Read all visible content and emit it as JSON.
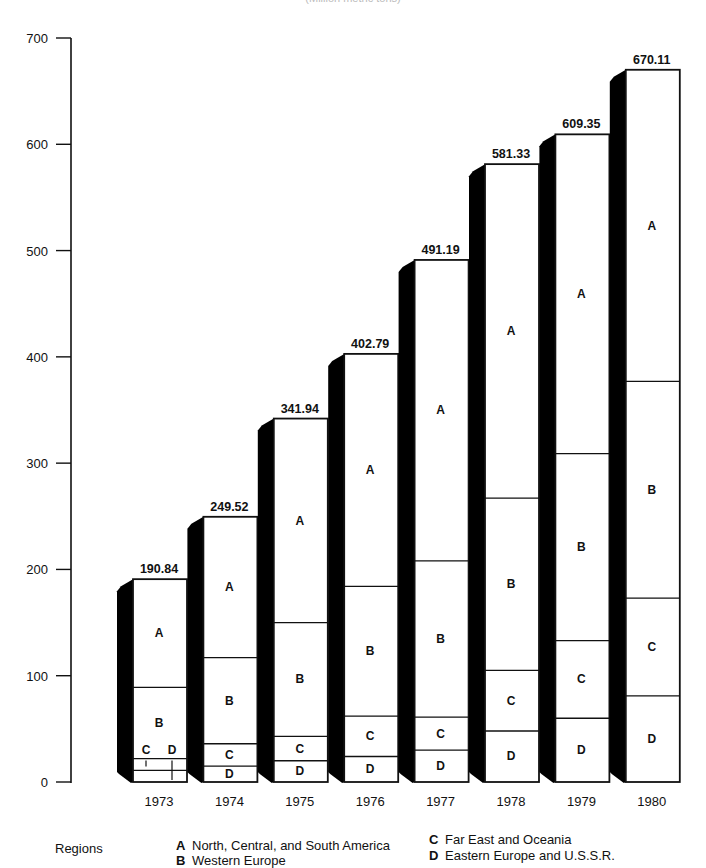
{
  "chart_data": {
    "type": "bar",
    "stacked": true,
    "title": "",
    "subtitle": "(Million metric tons)",
    "xlabel": "",
    "ylabel": "",
    "ylim": [
      0,
      700
    ],
    "yticks": [
      0,
      100,
      200,
      300,
      400,
      500,
      600,
      700
    ],
    "grid": false,
    "legend_position": "bottom",
    "categories": [
      "1973",
      "1974",
      "1975",
      "1976",
      "1977",
      "1978",
      "1979",
      "1980"
    ],
    "totals": [
      "190.84",
      "249.52",
      "341.94",
      "402.79",
      "491.19",
      "581.33",
      "609.35",
      "670.11"
    ],
    "series": [
      {
        "key": "D",
        "name": "Eastern Europe and U.S.S.R.",
        "values": [
          11,
          15,
          20,
          24,
          30,
          48,
          60,
          81
        ]
      },
      {
        "key": "C",
        "name": "Far East and Oceania",
        "values": [
          11,
          21,
          23,
          38,
          31,
          57,
          73,
          92
        ]
      },
      {
        "key": "B",
        "name": "Western Europe",
        "values": [
          67,
          81,
          107,
          122,
          147,
          162,
          176,
          204
        ]
      },
      {
        "key": "A",
        "name": "North, Central, and South America",
        "values": [
          102,
          132,
          192,
          219,
          283,
          314,
          300,
          293
        ]
      }
    ]
  },
  "legend": {
    "title": "Regions",
    "items": [
      {
        "key": "A",
        "label": "North, Central, and South America"
      },
      {
        "key": "B",
        "label": "Western Europe"
      },
      {
        "key": "C",
        "label": "Far East and Oceania"
      },
      {
        "key": "D",
        "label": "Eastern Europe and U.S.S.R."
      }
    ]
  },
  "colors": {
    "bar_face": "#ffffff",
    "bar_side": "#000000",
    "line": "#111111"
  }
}
